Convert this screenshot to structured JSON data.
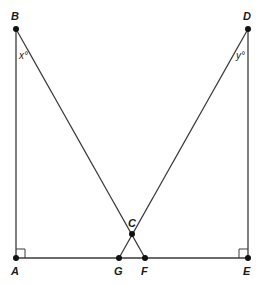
{
  "diagram": {
    "type": "geometry",
    "points": {
      "A": {
        "label": "A",
        "x": 16,
        "y": 258
      },
      "B": {
        "label": "B",
        "x": 16,
        "y": 29
      },
      "C": {
        "label": "C",
        "x": 132,
        "y": 234
      },
      "D": {
        "label": "D",
        "x": 248,
        "y": 29
      },
      "E": {
        "label": "E",
        "x": 248,
        "y": 258
      },
      "F": {
        "label": "F",
        "x": 145,
        "y": 258
      },
      "G": {
        "label": "G",
        "x": 119,
        "y": 258
      }
    },
    "angles": {
      "x": {
        "label": "x°",
        "vertex": "B"
      },
      "y": {
        "label": "y°",
        "vertex": "D"
      }
    },
    "right_angles": [
      "A",
      "E"
    ],
    "segments": [
      "AB",
      "AE",
      "BF",
      "DG",
      "DE"
    ]
  }
}
